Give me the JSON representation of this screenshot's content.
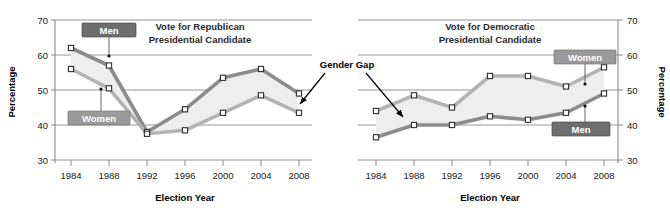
{
  "figure": {
    "background": "#ffffff",
    "annotation": {
      "label": "Gender Gap",
      "name": "gender-gap-annotation"
    }
  },
  "colors": {
    "men_line_republican": "#8c8c8c",
    "women_line_republican": "#b3b3b3",
    "men_line_democratic": "#8c8c8c",
    "women_line_democratic": "#b3b3b3",
    "gap_fill": "#eeeeee",
    "tag_dark": "#6e6e6e",
    "tag_light": "#9a9a9a",
    "axis": "#8a8a8a",
    "text": "#1a1a1a"
  },
  "chart_data": [
    {
      "type": "line",
      "id": "republican",
      "title": "Vote for Republican\nPresidential Candidate",
      "title_line1": "Vote for Republican",
      "title_line2": "Presidential Candidate",
      "xlabel": "Election Year",
      "ylabel": "Percentage",
      "categories": [
        "1984",
        "1988",
        "1992",
        "1996",
        "2000",
        "2004",
        "2008"
      ],
      "x": [
        1984,
        1988,
        1992,
        1996,
        2000,
        2004,
        2008
      ],
      "ylim": [
        30,
        70
      ],
      "yticks": [
        30,
        40,
        50,
        60,
        70
      ],
      "grid": true,
      "y_axis_side": "left",
      "legend_position": "inline-labels",
      "series": [
        {
          "name": "Men",
          "values": [
            62,
            57,
            38,
            44.5,
            53.5,
            56,
            49
          ],
          "tag_style": "dark",
          "tag_anchor_index": 1,
          "tag_anchor_value": 59.5
        },
        {
          "name": "Women",
          "values": [
            56,
            50.5,
            37.5,
            38.5,
            43.5,
            48.5,
            43.5
          ],
          "tag_style": "light",
          "tag_anchor_index": 1,
          "tag_anchor_value": 52
        }
      ]
    },
    {
      "type": "line",
      "id": "democratic",
      "title": "Vote for Democratic\nPresidential Candidate",
      "title_line1": "Vote for Democratic",
      "title_line2": "Presidential Candidate",
      "xlabel": "Election Year",
      "ylabel": "Percentage",
      "categories": [
        "1984",
        "1988",
        "1992",
        "1996",
        "2000",
        "2004",
        "2008"
      ],
      "x": [
        1984,
        1988,
        1992,
        1996,
        2000,
        2004,
        2008
      ],
      "ylim": [
        30,
        70
      ],
      "yticks": [
        30,
        40,
        50,
        60,
        70
      ],
      "grid": true,
      "y_axis_side": "right",
      "legend_position": "inline-labels",
      "series": [
        {
          "name": "Women",
          "values": [
            44,
            48.5,
            45,
            54,
            54,
            51,
            56.5
          ],
          "tag_style": "light",
          "tag_anchor_index": 5,
          "tag_anchor_value": 52.5
        },
        {
          "name": "Men",
          "values": [
            36.5,
            40,
            40,
            42.5,
            41.5,
            43.5,
            49
          ],
          "tag_style": "dark",
          "tag_anchor_index": 5,
          "tag_anchor_value": 45.5
        }
      ]
    }
  ]
}
